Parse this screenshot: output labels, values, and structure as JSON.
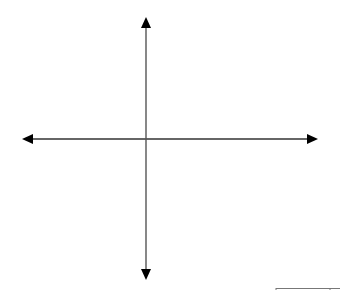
{
  "diagram": {
    "type": "cartesian-axes",
    "background": "#ffffff",
    "axis_color": "#000000",
    "x_axis": {
      "y": 139,
      "x_start": 22,
      "x_end": 318,
      "arrows": [
        "left",
        "right"
      ]
    },
    "y_axis": {
      "x": 146,
      "y_start": 17,
      "y_end": 280,
      "arrows": [
        "up",
        "down"
      ]
    },
    "corner_line": {
      "y": 288,
      "x_start": 276,
      "x_end": 340,
      "tick_x": 330
    }
  }
}
